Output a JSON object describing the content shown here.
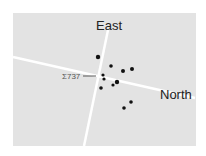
{
  "labels": {
    "east": "East",
    "north": "North",
    "star": "Σ737"
  },
  "colors": {
    "panel": "#e3e3e3",
    "lines": "#ffffff",
    "stars": "#111111"
  },
  "stars": [
    {
      "x": 98,
      "y": 57,
      "r": 2.2
    },
    {
      "x": 111,
      "y": 66,
      "r": 1.8
    },
    {
      "x": 123,
      "y": 71,
      "r": 2
    },
    {
      "x": 132,
      "y": 69,
      "r": 2
    },
    {
      "x": 103,
      "y": 75,
      "r": 1.6
    },
    {
      "x": 104,
      "y": 79,
      "r": 1.6
    },
    {
      "x": 117,
      "y": 82,
      "r": 2.2
    },
    {
      "x": 113,
      "y": 85,
      "r": 1.6
    },
    {
      "x": 101,
      "y": 88,
      "r": 1.8
    },
    {
      "x": 131,
      "y": 102,
      "r": 1.8
    },
    {
      "x": 124,
      "y": 108,
      "r": 1.8
    }
  ]
}
